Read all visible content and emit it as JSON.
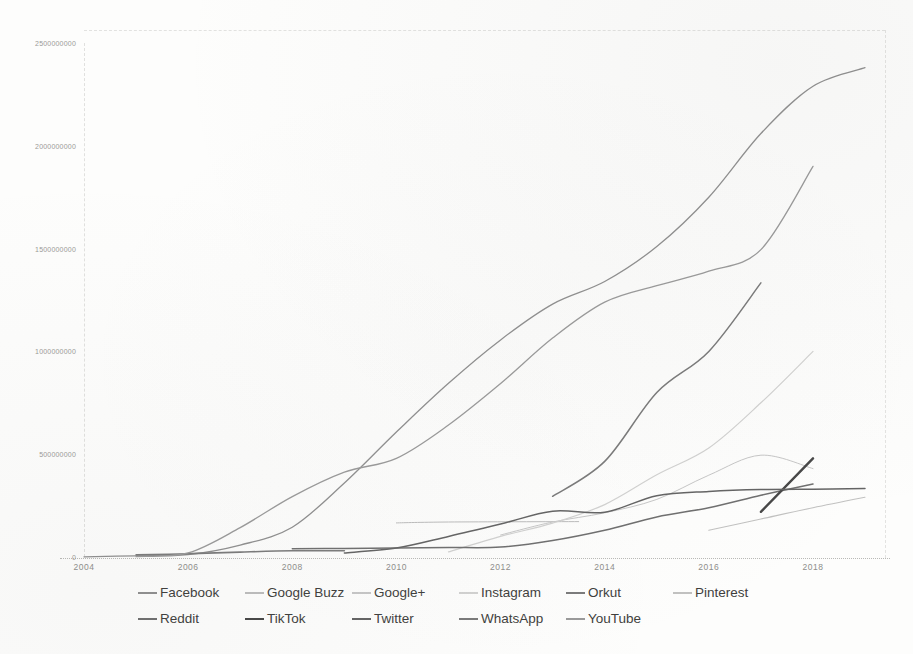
{
  "chart_data": {
    "type": "line",
    "title": "",
    "xlabel": "",
    "ylabel": "",
    "unit": "users (millions)",
    "x_axis": {
      "tick_years": [
        2004,
        2006,
        2008,
        2010,
        2012,
        2014,
        2016,
        2018
      ],
      "tick_labels": [
        "2004",
        "2006",
        "2008",
        "2010",
        "2012",
        "2014",
        "2016",
        "2018"
      ],
      "range": [
        2004,
        2019.4
      ]
    },
    "y_axis": {
      "tick_values_millions": [
        0,
        500,
        1000,
        1500,
        2000,
        2500
      ],
      "tick_labels": [
        "0",
        "500000000",
        "1000000000",
        "1500000000",
        "2000000000",
        "2500000000"
      ],
      "range_millions": [
        0,
        2500
      ]
    },
    "grid": false,
    "legend_position": "bottom",
    "legend_rows": [
      [
        "Facebook",
        "Google Buzz",
        "Google+",
        "Instagram",
        "Orkut",
        "Pinterest"
      ],
      [
        "Reddit",
        "TikTok",
        "Twitter",
        "WhatsApp",
        "YouTube"
      ]
    ],
    "series": [
      {
        "name": "Facebook",
        "color": "#8f8f8f",
        "stroke_width": 1.3,
        "points": [
          [
            2004,
            1
          ],
          [
            2005,
            6
          ],
          [
            2006,
            12
          ],
          [
            2007,
            58
          ],
          [
            2008,
            145
          ],
          [
            2009,
            360
          ],
          [
            2010,
            608
          ],
          [
            2011,
            845
          ],
          [
            2012,
            1056
          ],
          [
            2013,
            1230
          ],
          [
            2014,
            1340
          ],
          [
            2015,
            1510
          ],
          [
            2016,
            1750
          ],
          [
            2017,
            2060
          ],
          [
            2018,
            2290
          ],
          [
            2019,
            2380
          ]
        ]
      },
      {
        "name": "Google Buzz",
        "color": "#bcbcbc",
        "stroke_width": 1,
        "points": [
          [
            2010,
            166
          ],
          [
            2011,
            170
          ],
          [
            2013.5,
            172
          ]
        ]
      },
      {
        "name": "Google+",
        "color": "#c6c6c6",
        "stroke_width": 1,
        "points": [
          [
            2012,
            107
          ],
          [
            2013,
            170
          ],
          [
            2014,
            215
          ],
          [
            2015,
            280
          ],
          [
            2016,
            398
          ],
          [
            2017,
            495
          ],
          [
            2018,
            430
          ]
        ]
      },
      {
        "name": "Instagram",
        "color": "#d1d1d0",
        "stroke_width": 1.2,
        "points": [
          [
            2011,
            25
          ],
          [
            2012,
            100
          ],
          [
            2013,
            165
          ],
          [
            2014,
            255
          ],
          [
            2015,
            400
          ],
          [
            2016,
            530
          ],
          [
            2017,
            750
          ],
          [
            2018,
            1000
          ]
        ]
      },
      {
        "name": "Orkut",
        "color": "#7b7b7b",
        "stroke_width": 1.6,
        "points": [
          [
            2005,
            10
          ],
          [
            2006,
            16
          ],
          [
            2007,
            24
          ],
          [
            2008,
            30
          ],
          [
            2009,
            30
          ]
        ]
      },
      {
        "name": "Pinterest",
        "color": "#c1c1c0",
        "stroke_width": 1.1,
        "points": [
          [
            2016,
            130
          ],
          [
            2017,
            185
          ],
          [
            2018,
            240
          ],
          [
            2019,
            291
          ]
        ]
      },
      {
        "name": "Reddit",
        "color": "#6f6f6f",
        "stroke_width": 1.5,
        "points": [
          [
            2008,
            40
          ],
          [
            2009,
            42
          ],
          [
            2010,
            44
          ],
          [
            2011,
            46
          ],
          [
            2012,
            48
          ],
          [
            2013,
            80
          ],
          [
            2014,
            130
          ],
          [
            2015,
            195
          ],
          [
            2016,
            240
          ],
          [
            2017,
            300
          ],
          [
            2018,
            355
          ]
        ]
      },
      {
        "name": "TikTok",
        "color": "#474747",
        "stroke_width": 2.4,
        "points": [
          [
            2017,
            220
          ],
          [
            2018,
            480
          ]
        ]
      },
      {
        "name": "Twitter",
        "color": "#646464",
        "stroke_width": 1.5,
        "points": [
          [
            2009,
            20
          ],
          [
            2010,
            44
          ],
          [
            2011,
            100
          ],
          [
            2012,
            160
          ],
          [
            2013,
            223
          ],
          [
            2014,
            218
          ],
          [
            2015,
            298
          ],
          [
            2016,
            319
          ],
          [
            2017,
            328
          ],
          [
            2018,
            330
          ],
          [
            2019,
            333
          ]
        ]
      },
      {
        "name": "WhatsApp",
        "color": "#7a7a7a",
        "stroke_width": 1.5,
        "points": [
          [
            2013,
            295
          ],
          [
            2014,
            465
          ],
          [
            2015,
            800
          ],
          [
            2016,
            1000
          ],
          [
            2017,
            1333
          ]
        ]
      },
      {
        "name": "YouTube",
        "color": "#9a9a9a",
        "stroke_width": 1.3,
        "points": [
          [
            2005,
            2
          ],
          [
            2006,
            20
          ],
          [
            2007,
            143
          ],
          [
            2008,
            294
          ],
          [
            2009,
            413
          ],
          [
            2010,
            480
          ],
          [
            2011,
            642
          ],
          [
            2012,
            844
          ],
          [
            2013,
            1065
          ],
          [
            2014,
            1240
          ],
          [
            2015,
            1320
          ],
          [
            2016,
            1390
          ],
          [
            2017,
            1495
          ],
          [
            2018,
            1900
          ]
        ]
      }
    ]
  }
}
